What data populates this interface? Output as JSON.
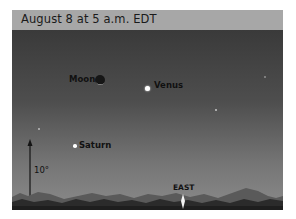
{
  "header": {
    "title": "August 8 at 5 a.m. EDT"
  },
  "sky_objects": {
    "moon": {
      "label": "Moon",
      "phase": "waning crescent"
    },
    "venus": {
      "label": "Venus"
    },
    "saturn": {
      "label": "Saturn"
    }
  },
  "scale": {
    "label": "10°"
  },
  "direction": {
    "label": "EAST",
    "marker": "sun-glow-icon"
  },
  "colors": {
    "header_bg": "#a7a7a7",
    "sky_top": "#3a3a3a",
    "sky_bottom": "#8a8a8a",
    "hills_far": "#555555",
    "hills_near": "#222222",
    "planet": "#ffffff"
  }
}
